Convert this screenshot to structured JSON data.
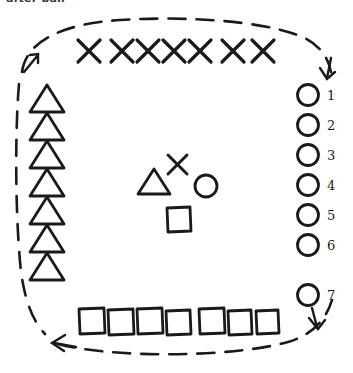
{
  "caption": {
    "text": "after ball"
  },
  "colors": {
    "ink": "#1a1a1a",
    "background": "#ffffff",
    "caption": "#3a3a3a"
  },
  "diagram": {
    "flow_loop": {
      "style": "dashed",
      "shape": "rounded-rectangle",
      "direction": "counter-clockwise",
      "arrow_count": 3,
      "arrows": [
        {
          "name": "arrow-top-left",
          "points": "up-right"
        },
        {
          "name": "arrow-top-right",
          "points": "down"
        },
        {
          "name": "arrow-bottom-right",
          "points": "down"
        },
        {
          "name": "arrow-bottom-left",
          "points": "left"
        }
      ]
    },
    "groups": [
      {
        "name": "top-row-crosses",
        "symbol": "cross",
        "count": 7,
        "position": "top",
        "labels": []
      },
      {
        "name": "left-column-triangles",
        "symbol": "triangle",
        "count": 7,
        "position": "left",
        "labels": []
      },
      {
        "name": "right-column-circles",
        "symbol": "circle",
        "count": 7,
        "position": "right",
        "labels": [
          "1",
          "2",
          "3",
          "4",
          "5",
          "6",
          "7"
        ]
      },
      {
        "name": "bottom-row-squares",
        "symbol": "square",
        "count": 7,
        "position": "bottom",
        "labels": []
      },
      {
        "name": "center-cluster",
        "position": "center",
        "symbols": [
          "cross",
          "triangle",
          "circle",
          "square"
        ],
        "count": 4,
        "labels": []
      }
    ],
    "circle_numbers": [
      "1",
      "2",
      "3",
      "4",
      "5",
      "6",
      "7"
    ]
  }
}
